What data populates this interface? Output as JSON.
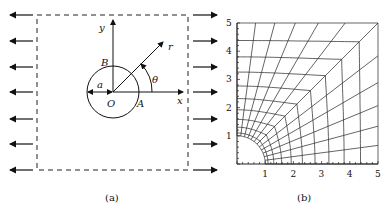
{
  "panel_a": {
    "caption": "(a)",
    "labels": {
      "y": "y",
      "x": "x",
      "r": "r",
      "theta": "θ",
      "a": "a",
      "O": "O",
      "A": "A",
      "B": "B"
    }
  },
  "panel_b": {
    "caption": "(b)",
    "x_ticks": [
      "1",
      "2",
      "3",
      "4",
      "5"
    ],
    "y_ticks": [
      "1",
      "2",
      "3",
      "4",
      "5"
    ]
  }
}
